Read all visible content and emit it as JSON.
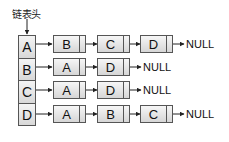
{
  "diagram": {
    "type": "adjacency-list",
    "head_label": "链表头",
    "null_label": "NULL",
    "head_nodes": [
      "A",
      "B",
      "C",
      "D"
    ],
    "rows": [
      {
        "head": "A",
        "nodes": [
          "B",
          "C",
          "D"
        ]
      },
      {
        "head": "B",
        "nodes": [
          "A",
          "D"
        ]
      },
      {
        "head": "C",
        "nodes": [
          "A",
          "D"
        ]
      },
      {
        "head": "D",
        "nodes": [
          "A",
          "B",
          "C"
        ]
      }
    ]
  }
}
